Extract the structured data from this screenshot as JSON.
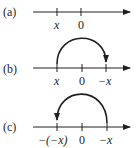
{
  "diagrams": [
    {
      "part_label": "(a)",
      "ticks": [
        {
          "label": "x",
          "italic": true
        },
        {
          "label": "0",
          "italic": false
        }
      ],
      "arc": null
    },
    {
      "part_label": "(b)",
      "ticks": [
        {
          "label": "x",
          "italic": true
        },
        {
          "label": "0",
          "italic": false
        },
        {
          "label": "−x",
          "italic": true
        }
      ],
      "arc": {
        "from": "x",
        "to": "−x",
        "direction": "right"
      }
    },
    {
      "part_label": "(c)",
      "ticks": [
        {
          "label": "−(−x)",
          "italic": true
        },
        {
          "label": "0",
          "italic": false
        },
        {
          "label": "−x",
          "italic": true
        }
      ],
      "arc": {
        "from": "−x",
        "to": "−(−x)",
        "direction": "left"
      }
    }
  ],
  "colors": {
    "ink": "#231f20",
    "background": "#ffffff"
  }
}
